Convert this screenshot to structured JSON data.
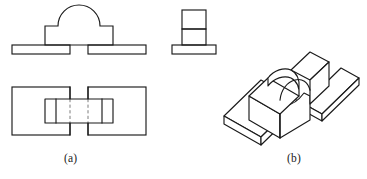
{
  "figure": {
    "kind": "engineering-drawing",
    "line_color": "#1a1a1a",
    "hidden_line_color": "#7d7d7d",
    "background_color": "#ffffff"
  },
  "captions": {
    "a": "(a)",
    "b": "(b)"
  },
  "panels": [
    {
      "id": "orthographic",
      "caption": "(a)",
      "views": [
        {
          "id": "front-view",
          "name": "front view",
          "features": [
            "rectangular block body",
            "semicircular arch on top of block",
            "base plate left segment",
            "base plate right segment"
          ]
        },
        {
          "id": "side-view",
          "name": "right side view",
          "features": [
            "narrow vertical rectangle upper division",
            "narrow vertical rectangle lower division",
            "base plate"
          ]
        },
        {
          "id": "top-view",
          "name": "top view",
          "features": [
            "left base plate rectangle",
            "right base plate rectangle",
            "central block rectangle",
            "left vertical division line",
            "right vertical division line",
            "two hidden centerlines"
          ]
        }
      ]
    },
    {
      "id": "pictorial",
      "caption": "(b)",
      "views": [
        {
          "id": "isometric-view",
          "name": "isometric pictorial",
          "features": [
            "front base plate",
            "rear base plate",
            "raised block with arched cutout",
            "curved arch surface",
            "block top face",
            "block side faces"
          ]
        }
      ]
    }
  ],
  "geometry": {
    "front_view": {
      "base_left_rect": {
        "x": 12,
        "y": 45,
        "w": 58,
        "h": 9
      },
      "base_right_rect": {
        "x": 88,
        "y": 45,
        "w": 58,
        "h": 9
      },
      "block": {
        "x": 45,
        "y": 26,
        "w": 68,
        "h": 19
      },
      "arch_radius": 21,
      "arch_center_x": 79,
      "arch_base_y": 26
    },
    "side_view": {
      "base_rect": {
        "x": 172,
        "y": 45,
        "w": 44,
        "h": 9
      },
      "upper_rect": {
        "x": 182,
        "y": 10,
        "w": 24,
        "h": 19
      },
      "lower_rect": {
        "x": 182,
        "y": 29,
        "w": 24,
        "h": 16
      }
    },
    "top_view": {
      "left_rect": {
        "x": 12,
        "y": 87,
        "w": 58,
        "h": 48
      },
      "right_rect": {
        "x": 88,
        "y": 87,
        "w": 58,
        "h": 48
      },
      "center_rect": {
        "x": 45,
        "y": 99,
        "w": 68,
        "h": 24
      },
      "divider_left_x": 56,
      "divider_right_x": 102,
      "hidden_line_left_x": 70,
      "hidden_line_right_x": 88
    }
  }
}
